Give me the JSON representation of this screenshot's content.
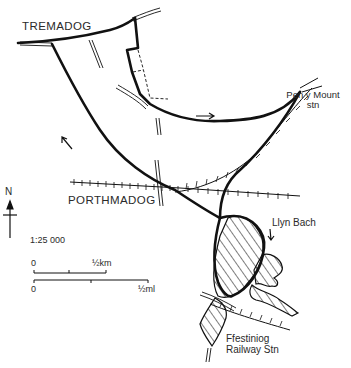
{
  "map": {
    "width": 351,
    "height": 368,
    "background": "#ffffff",
    "ink": "#111111",
    "labels": {
      "tremadog": "TREMADOG",
      "porthmadog": "PORTHMADOG",
      "pen_y_mount_line1": "Pen y Mount",
      "pen_y_mount_line2": "stn",
      "llyn_bach": "Llyn Bach",
      "ffestiniog_line1": "Ffestiniog",
      "ffestiniog_line2": "Railway Stn"
    },
    "north_arrow": {
      "label": "N"
    },
    "scale": {
      "ratio": "1:25 000",
      "km_zero": "0",
      "km_label": "½km",
      "mi_zero": "0",
      "mi_label": "½ml"
    },
    "legend_features": [
      "walking-route",
      "roads",
      "railway",
      "footpath-dashed",
      "water-hatched",
      "direction-arrows"
    ]
  }
}
